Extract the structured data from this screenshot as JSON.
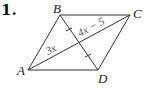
{
  "problem_number": "1.",
  "vertices": {
    "A": "A",
    "B": "B",
    "C": "C",
    "D": "D"
  },
  "segment_labels": {
    "AE": "3x",
    "EC": "4x − 5"
  },
  "colors": {
    "stroke": "#333333",
    "label": "#222222",
    "expression": "#555555"
  }
}
